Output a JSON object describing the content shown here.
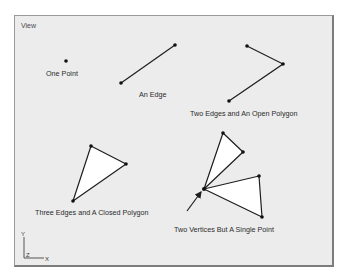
{
  "viewport": {
    "title": "View"
  },
  "colors": {
    "background": "#ececec",
    "frame": "#7c7c7c",
    "stroke": "#1e1e1e",
    "face_fill": "#ffffff"
  },
  "examples": [
    {
      "id": "one-point",
      "label": "One Point",
      "vertices": [
        [
          66,
          61
        ]
      ]
    },
    {
      "id": "an-edge",
      "label": "An Edge",
      "vertices": [
        [
          121,
          83
        ],
        [
          175,
          45
        ]
      ]
    },
    {
      "id": "two-edges-open-polygon",
      "label": "Two Edges and An Open Polygon",
      "vertices": [
        [
          247,
          46
        ],
        [
          283,
          64
        ],
        [
          229,
          101
        ]
      ]
    },
    {
      "id": "three-edges-closed-polygon",
      "label": "Three Edges and A Closed Polygon",
      "vertices": [
        [
          91,
          146
        ],
        [
          126,
          164
        ],
        [
          73,
          201
        ]
      ]
    },
    {
      "id": "two-vertices-single-point",
      "label": "Two Vertices But A Single Point",
      "triangles": [
        [
          [
            223,
            133
          ],
          [
            243,
            152
          ],
          [
            204,
            189
          ]
        ],
        [
          [
            204,
            189
          ],
          [
            259,
            176
          ],
          [
            262,
            217
          ]
        ]
      ]
    }
  ],
  "arrow": {
    "from": [
      187,
      211
    ],
    "to": [
      202,
      191
    ]
  },
  "axes": {
    "y_label": "Y",
    "z_label": "Z",
    "x_label": "X"
  }
}
